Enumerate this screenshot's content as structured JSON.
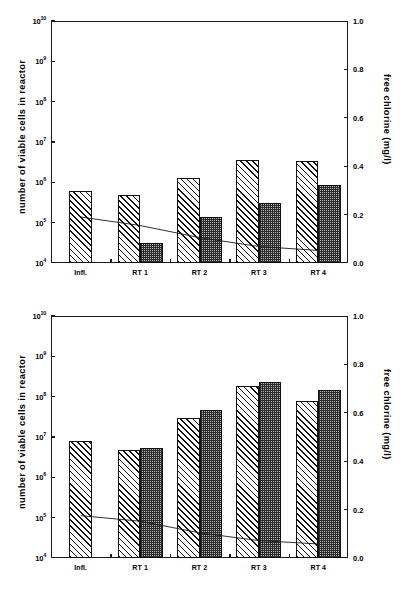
{
  "figure": {
    "panels": [
      "top",
      "bottom"
    ]
  },
  "chart_data": [
    {
      "panel": "top",
      "type": "bar",
      "title": "",
      "categories": [
        "Infl.",
        "RT 1",
        "RT 2",
        "RT 3",
        "RT 4"
      ],
      "xlabel": "",
      "ylabel": "number of viable cells in reactor",
      "yscale": "log",
      "ylim": [
        10000,
        10000000000
      ],
      "yticks": [
        10000,
        100000,
        1000000,
        10000000,
        100000000,
        1000000000,
        10000000000
      ],
      "ytick_labels": [
        "10⁴",
        "10⁵",
        "10⁶",
        "10⁷",
        "10⁸",
        "10⁹",
        "10¹⁰"
      ],
      "y2label": "free chlorine (mg/l)",
      "y2lim": [
        0.0,
        1.0
      ],
      "y2ticks": [
        0.0,
        0.2,
        0.4,
        0.6,
        0.8,
        1.0
      ],
      "y2tick_labels": [
        "0.0",
        "0.2",
        "0.4",
        "0.6",
        "0.8",
        "1.0"
      ],
      "grid": false,
      "legend": "none",
      "series": [
        {
          "name": "hatched-bars",
          "pattern": "diagonal-hatch",
          "values": [
            600000,
            480000,
            1300000,
            3600000,
            3400000
          ]
        },
        {
          "name": "dotted-bars",
          "pattern": "dense-dots",
          "values": [
            null,
            32000,
            140000,
            300000,
            850000
          ]
        },
        {
          "name": "free-chlorine-line",
          "pattern": "line",
          "axis": "right",
          "values": [
            0.19,
            0.155,
            0.105,
            0.068,
            0.052
          ]
        }
      ]
    },
    {
      "panel": "bottom",
      "type": "bar",
      "title": "",
      "categories": [
        "Infl.",
        "RT 1",
        "RT 2",
        "RT 3",
        "RT 4"
      ],
      "xlabel": "",
      "ylabel": "number of viable cells in reactor",
      "yscale": "log",
      "ylim": [
        10000,
        10000000000
      ],
      "yticks": [
        10000,
        100000,
        1000000,
        10000000,
        100000000,
        1000000000,
        10000000000
      ],
      "ytick_labels": [
        "10⁴",
        "10⁵",
        "10⁶",
        "10⁷",
        "10⁸",
        "10⁹",
        "10¹⁰"
      ],
      "y2label": "free chlorine (mg/l)",
      "y2lim": [
        0.0,
        1.0
      ],
      "y2ticks": [
        0.0,
        0.2,
        0.4,
        0.6,
        0.8,
        1.0
      ],
      "y2tick_labels": [
        "0.0",
        "0.2",
        "0.4",
        "0.6",
        "0.8",
        "1.0"
      ],
      "grid": false,
      "legend": "none",
      "series": [
        {
          "name": "hatched-bars",
          "pattern": "diagonal-hatch",
          "values": [
            8000000,
            4700000,
            29000000,
            180000000,
            77000000
          ]
        },
        {
          "name": "dotted-bars",
          "pattern": "dense-dots",
          "values": [
            null,
            5200000,
            48000000,
            230000000,
            150000000
          ]
        },
        {
          "name": "free-chlorine-line",
          "pattern": "line",
          "axis": "right",
          "values": [
            0.175,
            0.152,
            0.104,
            0.072,
            0.058
          ]
        }
      ]
    }
  ]
}
